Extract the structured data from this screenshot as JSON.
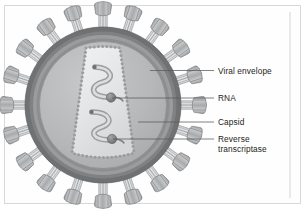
{
  "figure": {
    "background_color": "#ffffff",
    "frame_color": "#d8d8d8"
  },
  "labels": [
    {
      "id": "viral-envelope",
      "text": "Viral envelope",
      "lines": [
        "Viral envelope"
      ],
      "x": 218,
      "y": 67,
      "leader": {
        "x1": 150,
        "y1": 70.5,
        "x2": 214,
        "y2": 70.5
      }
    },
    {
      "id": "rna",
      "text": "RNA",
      "lines": [
        "RNA"
      ],
      "x": 218,
      "y": 94,
      "leader": {
        "x1": 112,
        "y1": 98.0,
        "x2": 214,
        "y2": 98.0
      }
    },
    {
      "id": "capsid",
      "text": "Capsid",
      "lines": [
        "Capsid"
      ],
      "x": 218,
      "y": 118,
      "leader": {
        "x1": 138,
        "y1": 122.0,
        "x2": 214,
        "y2": 122.0
      }
    },
    {
      "id": "reverse-transcriptase",
      "text": "Reverse transcriptase",
      "lines": [
        "Reverse",
        "transcriptase"
      ],
      "x": 218,
      "y": 135,
      "leader": {
        "x1": 113,
        "y1": 139.0,
        "x2": 214,
        "y2": 139.0
      }
    }
  ],
  "rule": {
    "id": "right-rule",
    "x": 290,
    "y1": 12,
    "y2": 198
  },
  "virus": {
    "center_x": 103,
    "center_y": 105,
    "radii": {
      "envelope_outer": 78,
      "envelope_inner": 70,
      "matrix": 66,
      "core": 63
    },
    "spike_count": 20,
    "spike": {
      "stem_length": 13,
      "head_width": 17,
      "head_height": 13,
      "segments": 4
    }
  },
  "capsid": {
    "shape": "truncated-cone",
    "top_width": 34,
    "bottom_width": 56,
    "top_y": 48,
    "bottom_y": 160,
    "bead_count": 74,
    "bead_radius": 1.5
  },
  "rna": {
    "strand_count": 2,
    "description": "two wavy single-stranded RNA molecules"
  },
  "reverse_transcriptase": {
    "count": 2,
    "positions": [
      {
        "x": 111,
        "y": 98
      },
      {
        "x": 112,
        "y": 139
      }
    ],
    "radius": 4.6
  },
  "colors": {
    "envelope_outer": "#6f7173",
    "envelope_mid": "#8e9092",
    "matrix": "#a6a8aa",
    "core": "#b9babc",
    "capsid_fill": "#e6e7e8",
    "capsid_bead": "#9a9c9e",
    "spike_head": "#9c9ea0",
    "spike_head_light": "#c4c6c8",
    "spike_stem": "#e4e5e6",
    "rna_fill": "#cfd1d2",
    "rna_stroke": "#8d8f91",
    "rt_fill": "#808284",
    "leader": "#58595b",
    "text": "#231f20"
  }
}
